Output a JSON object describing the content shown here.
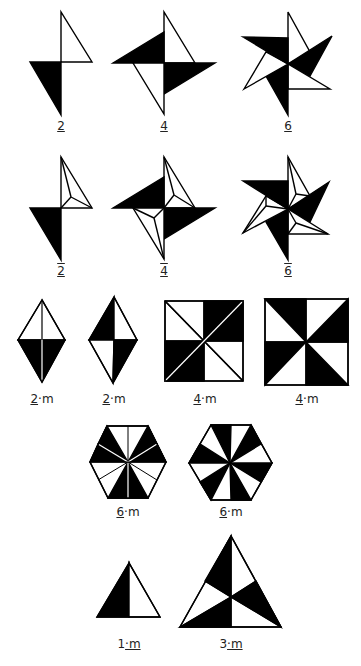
{
  "figure": {
    "colors": {
      "fill_dark": "#000000",
      "fill_light": "#ffffff",
      "stroke": "#000000"
    },
    "rows": [
      {
        "name": "rotation-axes",
        "items": [
          {
            "symbol": "2",
            "label_main": "2",
            "label_suffix": "",
            "style": "underline"
          },
          {
            "symbol": "4",
            "label_main": "4",
            "label_suffix": "",
            "style": "underline"
          },
          {
            "symbol": "6",
            "label_main": "6",
            "label_suffix": "",
            "style": "underline"
          }
        ]
      },
      {
        "name": "rotoinversion-axes",
        "items": [
          {
            "symbol": "2-bar",
            "label_main": "2",
            "label_suffix": "",
            "style": "overline-underline"
          },
          {
            "symbol": "4-bar",
            "label_main": "4",
            "label_suffix": "",
            "style": "overline-underline"
          },
          {
            "symbol": "6-bar",
            "label_main": "6",
            "label_suffix": "",
            "style": "overline-underline"
          }
        ]
      },
      {
        "name": "axis-with-mirror-2-4",
        "items": [
          {
            "symbol": "2·m",
            "label_main": "2",
            "label_suffix": "·m"
          },
          {
            "symbol": "2m",
            "label_main": "2",
            "label_suffix": "·m"
          },
          {
            "symbol": "4·m",
            "label_main": "4",
            "label_suffix": "·m"
          },
          {
            "symbol": "4m",
            "label_main": "4",
            "label_suffix": "·m"
          }
        ]
      },
      {
        "name": "axis-with-mirror-6",
        "items": [
          {
            "symbol": "6·m",
            "label_main": "6",
            "label_suffix": "·m"
          },
          {
            "symbol": "6m",
            "label_main": "6",
            "label_suffix": "·m"
          }
        ]
      },
      {
        "name": "axis-with-mirror-odd",
        "items": [
          {
            "symbol": "1·m",
            "label_main": "1",
            "label_suffix": "·m"
          },
          {
            "symbol": "3·m",
            "label_main": "3",
            "label_suffix": "·m"
          }
        ]
      }
    ]
  }
}
